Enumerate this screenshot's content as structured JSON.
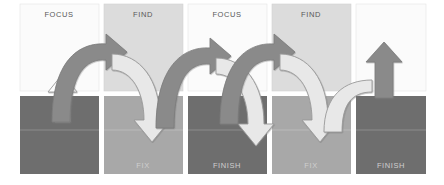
{
  "figure": {
    "type": "process-cycle-diagram",
    "repeat_count": 2
  },
  "palette": {
    "background": "#ffffff",
    "panel_top_light": "#fcfcfc",
    "panel_top_gray": "#dcdcdc",
    "panel_bottom_dark": "#6e6e6e",
    "panel_bottom_mid": "#a8a8a8",
    "arrow_dark": "#8a8a8a",
    "arrow_light": "#e8e8e8",
    "arrow_white": "#fdfdfd",
    "arrow_stroke": "#8f8f8f",
    "label_top_text": "#585858",
    "label_bottom_text": "#cfcfcf",
    "grid_gap": "#ffffff"
  },
  "grid": {
    "columns": 5,
    "rows": 2,
    "gap_px": 5,
    "left": 20,
    "top": 4,
    "panel_width": 79,
    "panel_height": 87
  },
  "panels": [
    {
      "id": "p1-top",
      "col": 0,
      "row": "top",
      "label": "FOCUS",
      "fill": "panel_top_light"
    },
    {
      "id": "p2-top",
      "col": 1,
      "row": "top",
      "label": "FIND",
      "fill": "panel_top_gray"
    },
    {
      "id": "p3-top",
      "col": 2,
      "row": "top",
      "label": "FOCUS",
      "fill": "panel_top_light"
    },
    {
      "id": "p4-top",
      "col": 3,
      "row": "top",
      "label": "FIND",
      "fill": "panel_top_gray"
    },
    {
      "id": "p5-top",
      "col": 4,
      "row": "top",
      "label": "",
      "fill": "panel_top_light"
    },
    {
      "id": "p1-bottom",
      "col": 0,
      "row": "bottom",
      "label": "",
      "fill": "panel_bottom_dark"
    },
    {
      "id": "p2-bottom",
      "col": 1,
      "row": "bottom",
      "label": "FIX",
      "fill": "panel_bottom_mid"
    },
    {
      "id": "p3-bottom",
      "col": 2,
      "row": "bottom",
      "label": "FINISH",
      "fill": "panel_bottom_dark"
    },
    {
      "id": "p4-bottom",
      "col": 3,
      "row": "bottom",
      "label": "FIX",
      "fill": "panel_bottom_mid"
    },
    {
      "id": "p5-bottom",
      "col": 4,
      "row": "bottom",
      "label": "FINISH",
      "fill": "panel_bottom_dark"
    }
  ],
  "arrows": [
    {
      "id": "arrow-start-up",
      "kind": "straight-up",
      "color": "arrow_white",
      "description": "white up arrow entering first cycle"
    },
    {
      "id": "arrow-focus-find-1",
      "kind": "curve-up-right",
      "color": "arrow_dark",
      "description": "dark curved arrow from FOCUS up to FIND"
    },
    {
      "id": "arrow-find-fix-1",
      "kind": "curve-down-right",
      "color": "arrow_light",
      "description": "light curved arrow from FIND down to FIX"
    },
    {
      "id": "arrow-fix-finish-1",
      "kind": "curve-up-right",
      "color": "arrow_dark",
      "description": "dark curved arrow from FIX up to FINISH"
    },
    {
      "id": "arrow-finish-focus-1",
      "kind": "curve-down-right",
      "color": "arrow_light",
      "description": "light curved arrow from FINISH down to next FOCUS"
    },
    {
      "id": "arrow-focus-find-2",
      "kind": "curve-up-right",
      "color": "arrow_dark",
      "description": "dark curved arrow second cycle FOCUS to FIND"
    },
    {
      "id": "arrow-find-fix-2",
      "kind": "curve-down-right",
      "color": "arrow_light",
      "description": "light curved arrow second cycle FIND to FIX"
    },
    {
      "id": "arrow-end-up",
      "kind": "curve-up-exit",
      "color": "arrow_light",
      "description": "light arrow curving up and out at the end"
    },
    {
      "id": "arrow-final-up",
      "kind": "straight-up",
      "color": "arrow_dark",
      "description": "dark up arrow exiting the cycle"
    }
  ],
  "labels": {
    "focus": "FOCUS",
    "find": "FIND",
    "fix": "FIX",
    "finish": "FINISH"
  }
}
